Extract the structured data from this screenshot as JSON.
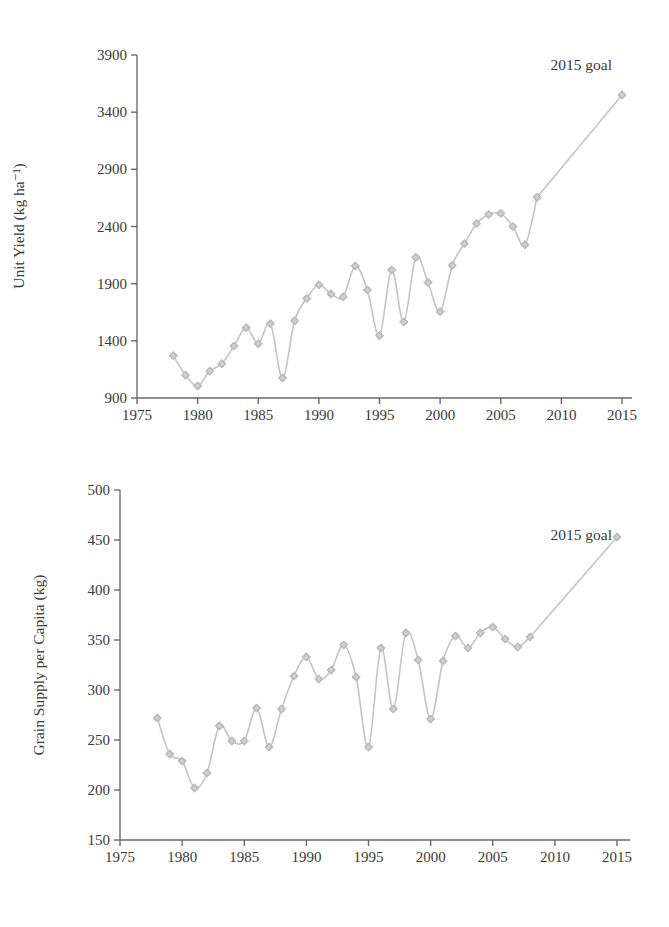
{
  "chart_data": [
    {
      "type": "line",
      "title": "",
      "xlabel": "",
      "ylabel": "Unit Yield (kg ha⁻¹)",
      "ylim": [
        900,
        3900
      ],
      "xlim": [
        1975,
        2015
      ],
      "grid": false,
      "legend": null,
      "yticks": [
        "900",
        "1400",
        "1900",
        "2400",
        "2900",
        "3400",
        "3900"
      ],
      "xticks": [
        "1975",
        "1980",
        "1985",
        "1990",
        "1995",
        "2000",
        "2005",
        "2010",
        "2015"
      ],
      "annotation": "2015 goal",
      "x": [
        1978,
        1979,
        1980,
        1981,
        1982,
        1983,
        1984,
        1985,
        1986,
        1987,
        1988,
        1989,
        1990,
        1991,
        1992,
        1993,
        1994,
        1995,
        1996,
        1997,
        1998,
        1999,
        2000,
        2001,
        2002,
        2003,
        2004,
        2005,
        2006,
        2007,
        2008,
        2015
      ],
      "values": [
        1270,
        1100,
        1005,
        1135,
        1200,
        1355,
        1515,
        1375,
        1550,
        1075,
        1575,
        1770,
        1890,
        1810,
        1785,
        2055,
        1845,
        1445,
        2020,
        1565,
        2130,
        1910,
        1655,
        2060,
        2250,
        2425,
        2505,
        2515,
        2400,
        2240,
        2655,
        3550
      ]
    },
    {
      "type": "line",
      "title": "",
      "xlabel": "",
      "ylabel": "Grain Supply per Capita (kg)",
      "ylim": [
        150,
        500
      ],
      "xlim": [
        1975,
        2015
      ],
      "grid": false,
      "legend": null,
      "yticks": [
        "150",
        "200",
        "250",
        "300",
        "350",
        "400",
        "450",
        "500"
      ],
      "xticks": [
        "1975",
        "1980",
        "1985",
        "1990",
        "1995",
        "2000",
        "2005",
        "2010",
        "2015"
      ],
      "annotation": "2015 goal",
      "x": [
        1978,
        1979,
        1980,
        1981,
        1982,
        1983,
        1984,
        1985,
        1986,
        1987,
        1988,
        1989,
        1990,
        1991,
        1992,
        1993,
        1994,
        1995,
        1996,
        1997,
        1998,
        1999,
        2000,
        2001,
        2002,
        2003,
        2004,
        2005,
        2006,
        2007,
        2008,
        2015
      ],
      "values": [
        272,
        236,
        229,
        202,
        217,
        264,
        249,
        249,
        282,
        243,
        281,
        314,
        333,
        311,
        320,
        345,
        313,
        243,
        342,
        281,
        357,
        330,
        271,
        329,
        354,
        342,
        357,
        363,
        351,
        343,
        353,
        453
      ]
    }
  ]
}
